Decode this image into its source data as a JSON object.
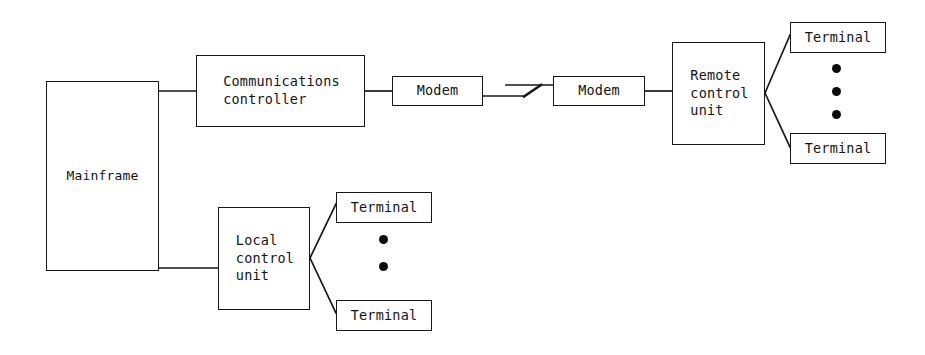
{
  "diagram": {
    "canvas": {
      "width": 925,
      "height": 355
    },
    "stroke_color": "#161616",
    "text_color": "#131313",
    "background_color": "#ffffff"
  },
  "nodes": {
    "mainframe": {
      "label": "Mainframe",
      "x": 46,
      "y": 81,
      "w": 113,
      "h": 190
    },
    "comm_controller": {
      "label": "Communications\ncontroller",
      "x": 196,
      "y": 55,
      "w": 169,
      "h": 72
    },
    "modem_local": {
      "label": "Modem",
      "x": 392,
      "y": 76,
      "w": 91,
      "h": 30
    },
    "modem_remote": {
      "label": "Modem",
      "x": 553,
      "y": 76,
      "w": 92,
      "h": 30
    },
    "remote_control": {
      "label": "Remote\ncontrol\nunit",
      "x": 672,
      "y": 42,
      "w": 93,
      "h": 103
    },
    "terminal_r1": {
      "label": "Terminal",
      "x": 790,
      "y": 22,
      "w": 96,
      "h": 31
    },
    "terminal_r2": {
      "label": "Terminal",
      "x": 790,
      "y": 133,
      "w": 96,
      "h": 31
    },
    "local_control": {
      "label": "Local\ncontrol\nunit",
      "x": 218,
      "y": 207,
      "w": 92,
      "h": 103
    },
    "terminal_l1": {
      "label": "Terminal",
      "x": 336,
      "y": 192,
      "w": 96,
      "h": 31
    },
    "terminal_l2": {
      "label": "Terminal",
      "x": 336,
      "y": 300,
      "w": 96,
      "h": 31
    }
  },
  "connectors": [
    {
      "name": "mainframe-to-comm-controller",
      "points": "159,91 196,91"
    },
    {
      "name": "comm-controller-to-modem-local",
      "points": "365,91 392,91"
    },
    {
      "name": "modem-local-to-break",
      "points": "483,96 523,96"
    },
    {
      "name": "break-diagonal",
      "points": "523,96 541,85"
    },
    {
      "name": "break-to-modem-remote",
      "points": "507,85 553,85"
    },
    {
      "name": "modem-remote-to-remote-control",
      "points": "645,91 672,91"
    },
    {
      "name": "remote-control-to-terminal-r1",
      "points": "765,93 790,35"
    },
    {
      "name": "remote-control-to-terminal-r2",
      "points": "765,93 790,146"
    },
    {
      "name": "mainframe-to-local-control-v",
      "points": "159,268 218,268"
    },
    {
      "name": "local-control-to-terminal-l1",
      "points": "310,258 336,205"
    },
    {
      "name": "local-control-to-terminal-l2",
      "points": "310,258 336,313"
    }
  ],
  "ellipsis_groups": [
    {
      "name": "remote-terminals-ellipsis",
      "dots": [
        {
          "x": 836,
          "y": 68
        },
        {
          "x": 836,
          "y": 91
        },
        {
          "x": 836,
          "y": 114
        }
      ]
    },
    {
      "name": "local-terminals-ellipsis",
      "dots": [
        {
          "x": 383,
          "y": 239
        },
        {
          "x": 383,
          "y": 266
        }
      ]
    }
  ]
}
